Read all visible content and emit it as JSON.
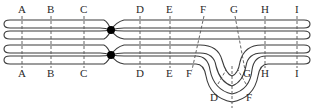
{
  "diagram": {
    "top_labels": [
      "A",
      "B",
      "C",
      "D",
      "E",
      "F",
      "G",
      "H",
      "I"
    ],
    "bottom_labels": [
      "A",
      "B",
      "C",
      "D",
      "E",
      "F",
      "G",
      "H",
      "I"
    ],
    "loop_labels": [
      "D",
      "F"
    ],
    "colors": {
      "line": "#3a3a3a",
      "centromere": "#000000",
      "background": "#ffffff"
    }
  }
}
